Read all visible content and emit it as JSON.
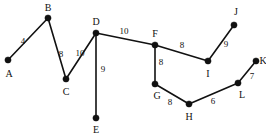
{
  "figure": {
    "kind": "weighted-undirected-graph",
    "width": 266,
    "height": 137,
    "background_color": "#ffffff",
    "ink_color": "#111111"
  },
  "nodes": [
    {
      "id": "A",
      "label": "A",
      "x": 8,
      "y": 60,
      "label_x": 9,
      "label_y": 74
    },
    {
      "id": "B",
      "label": "B",
      "x": 48,
      "y": 18,
      "label_x": 48,
      "label_y": 8
    },
    {
      "id": "C",
      "label": "C",
      "x": 66,
      "y": 79,
      "label_x": 66,
      "label_y": 92
    },
    {
      "id": "D",
      "label": "D",
      "x": 96,
      "y": 33,
      "label_x": 96,
      "label_y": 22
    },
    {
      "id": "E",
      "label": "E",
      "x": 96,
      "y": 118,
      "label_x": 96,
      "label_y": 130
    },
    {
      "id": "F",
      "label": "F",
      "x": 155,
      "y": 45,
      "label_x": 155,
      "label_y": 34
    },
    {
      "id": "G",
      "label": "G",
      "x": 155,
      "y": 84,
      "label_x": 157,
      "label_y": 96
    },
    {
      "id": "H",
      "label": "H",
      "x": 189,
      "y": 104,
      "label_x": 189,
      "label_y": 117
    },
    {
      "id": "I",
      "label": "I",
      "x": 208,
      "y": 61,
      "label_x": 208,
      "label_y": 74
    },
    {
      "id": "J",
      "label": "J",
      "x": 234,
      "y": 25,
      "label_x": 236,
      "label_y": 12
    },
    {
      "id": "K",
      "label": "K",
      "x": 256,
      "y": 61,
      "label_x": 263,
      "label_y": 61
    },
    {
      "id": "L",
      "label": "L",
      "x": 238,
      "y": 83,
      "label_x": 242,
      "label_y": 95
    }
  ],
  "edges": [
    {
      "from": "A",
      "to": "B",
      "weight": "4",
      "label_x": 23,
      "label_y": 41
    },
    {
      "from": "B",
      "to": "C",
      "weight": "8",
      "label_x": 61,
      "label_y": 54
    },
    {
      "from": "C",
      "to": "D",
      "weight": "10",
      "label_x": 80,
      "label_y": 53
    },
    {
      "from": "D",
      "to": "E",
      "weight": "9",
      "label_x": 103,
      "label_y": 69
    },
    {
      "from": "D",
      "to": "F",
      "weight": "10",
      "label_x": 124,
      "label_y": 31
    },
    {
      "from": "F",
      "to": "G",
      "weight": "8",
      "label_x": 161,
      "label_y": 62
    },
    {
      "from": "F",
      "to": "I",
      "weight": "8",
      "label_x": 182,
      "label_y": 45
    },
    {
      "from": "I",
      "to": "J",
      "weight": "9",
      "label_x": 226,
      "label_y": 44
    },
    {
      "from": "G",
      "to": "H",
      "weight": "8",
      "label_x": 170,
      "label_y": 102
    },
    {
      "from": "H",
      "to": "L",
      "weight": "6",
      "label_x": 213,
      "label_y": 101
    },
    {
      "from": "L",
      "to": "K",
      "weight": "7",
      "label_x": 252,
      "label_y": 76
    }
  ]
}
